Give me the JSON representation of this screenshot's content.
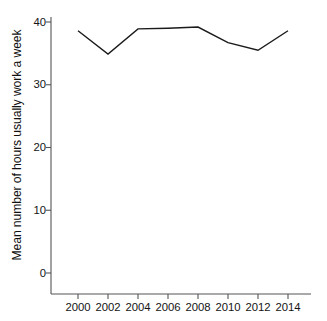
{
  "chart_data": {
    "type": "line",
    "title": "",
    "subtitle": "",
    "xlabel": "",
    "ylabel": "Mean number of hours usually work a week",
    "x": [
      2000,
      2002,
      2004,
      2006,
      2008,
      2010,
      2012,
      2014
    ],
    "categories": [
      "2000",
      "2002",
      "2004",
      "2006",
      "2008",
      "2010",
      "2012",
      "2014"
    ],
    "series": [
      {
        "name": "Mean number of hours usually work a week",
        "values": [
          38.6,
          34.9,
          38.9,
          39.0,
          39.2,
          36.7,
          35.5,
          38.6
        ],
        "color": "#1a1a1a",
        "line_width": 1.4,
        "markers": false
      }
    ],
    "xlim": [
      1999.0,
      2015.3
    ],
    "ylim": [
      0,
      43.3
    ],
    "xticks": [
      2000,
      2002,
      2004,
      2006,
      2008,
      2010,
      2012,
      2014
    ],
    "xtick_labels": [
      "2000",
      "2002",
      "2004",
      "2006",
      "2008",
      "2010",
      "2012",
      "2014"
    ],
    "yticks": [
      0,
      10,
      20,
      30,
      40
    ],
    "ytick_labels": [
      "0",
      "10",
      "20",
      "30",
      "40"
    ],
    "grid": false,
    "legend": false,
    "legend_position": "none",
    "axis_color": "#555555",
    "background_color": "#ffffff",
    "annotations": []
  },
  "figure": {
    "width": 327,
    "height": 321
  }
}
